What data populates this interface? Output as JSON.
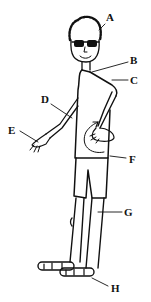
{
  "diagram": {
    "labels": [
      {
        "id": "A",
        "text": "A",
        "x": 106,
        "y": 18
      },
      {
        "id": "B",
        "text": "B",
        "x": 130,
        "y": 55
      },
      {
        "id": "C",
        "text": "C",
        "x": 130,
        "y": 75
      },
      {
        "id": "D",
        "text": "D",
        "x": 41,
        "y": 98
      },
      {
        "id": "E",
        "text": "E",
        "x": 8,
        "y": 128
      },
      {
        "id": "F",
        "text": "F",
        "x": 129,
        "y": 154
      },
      {
        "id": "G",
        "text": "G",
        "x": 124,
        "y": 207
      },
      {
        "id": "H",
        "text": "H",
        "x": 111,
        "y": 284
      }
    ]
  }
}
